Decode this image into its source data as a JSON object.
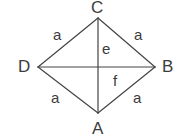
{
  "diagram": {
    "type": "geometry-figure",
    "shape": "rhombus-with-diagonals",
    "canvas": {
      "width": 180,
      "height": 140,
      "background": "#ffffff"
    },
    "stroke": {
      "color": "#444444",
      "width": 1.2
    },
    "text_color": "#3c3c3c",
    "vertices": [
      {
        "id": "C",
        "label": "C",
        "x": 98,
        "y": 18,
        "position": "top"
      },
      {
        "id": "D",
        "label": "D",
        "x": 38,
        "y": 67,
        "position": "left"
      },
      {
        "id": "B",
        "label": "B",
        "x": 155,
        "y": 67,
        "position": "right"
      },
      {
        "id": "A",
        "label": "A",
        "x": 98,
        "y": 113,
        "position": "bottom"
      }
    ],
    "center": {
      "x": 98,
      "y": 67
    },
    "sides": [
      {
        "id": "DC",
        "from": "D",
        "to": "C",
        "label": "a"
      },
      {
        "id": "CB",
        "from": "C",
        "to": "B",
        "label": "a"
      },
      {
        "id": "DA",
        "from": "D",
        "to": "A",
        "label": "a"
      },
      {
        "id": "AB",
        "from": "A",
        "to": "B",
        "label": "a"
      }
    ],
    "diagonals": [
      {
        "id": "CA",
        "from": "C",
        "to": "A",
        "label": "e",
        "orientation": "vertical"
      },
      {
        "id": "DB",
        "from": "D",
        "to": "B",
        "label": "f",
        "orientation": "horizontal"
      }
    ],
    "labels": {
      "vertex_c": "C",
      "vertex_d": "D",
      "vertex_b": "B",
      "vertex_a": "A",
      "side_dc": "a",
      "side_cb": "a",
      "side_da": "a",
      "side_ab": "a",
      "diagonal_e": "e",
      "diagonal_f": "f"
    }
  }
}
